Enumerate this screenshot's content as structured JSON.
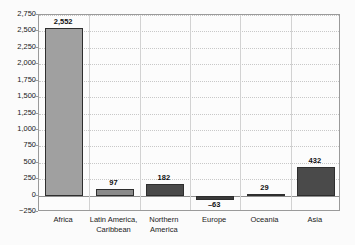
{
  "chart_data": {
    "type": "bar",
    "title": "",
    "subtitle": "",
    "xlabel": "",
    "ylabel": "",
    "categories": [
      "Africa",
      "Latin America, Caribbean",
      "Northern America",
      "Europe",
      "Oceania",
      "Asia"
    ],
    "category_lines": [
      [
        "Africa"
      ],
      [
        "Latin America,",
        "Caribbean"
      ],
      [
        "Northern",
        "America"
      ],
      [
        "Europe"
      ],
      [
        "Oceania"
      ],
      [
        "Asia"
      ]
    ],
    "values": [
      2552,
      97,
      182,
      -63,
      29,
      432
    ],
    "value_labels": [
      "2,552",
      "97",
      "182",
      "–63",
      "29",
      "432"
    ],
    "bar_colors": [
      "#a0a0a0",
      "#8a8a8a",
      "#4a4a4a",
      "#3a3a3a",
      "#3a3a3a",
      "#4a4a4a"
    ],
    "ylim": [
      -250,
      2750
    ],
    "ytick_values": [
      2750,
      2500,
      2250,
      2000,
      1750,
      1500,
      1250,
      1000,
      750,
      500,
      250,
      0,
      -250
    ],
    "ytick_labels": [
      "2,750",
      "2,500",
      "2,250",
      "2,000",
      "1,750",
      "1,500",
      "1,250",
      "1,000",
      "750",
      "500",
      "250",
      "0",
      "−250"
    ],
    "grid": true,
    "grid_axis": "y",
    "legend": "none",
    "zero_line": 0,
    "plot_background": "#fcfcfc",
    "page_background": "#fbfbfb",
    "grid_color": "#c8c8c8",
    "axis_color": "#9a9a9a",
    "separator_color": "#d2d2d2"
  }
}
